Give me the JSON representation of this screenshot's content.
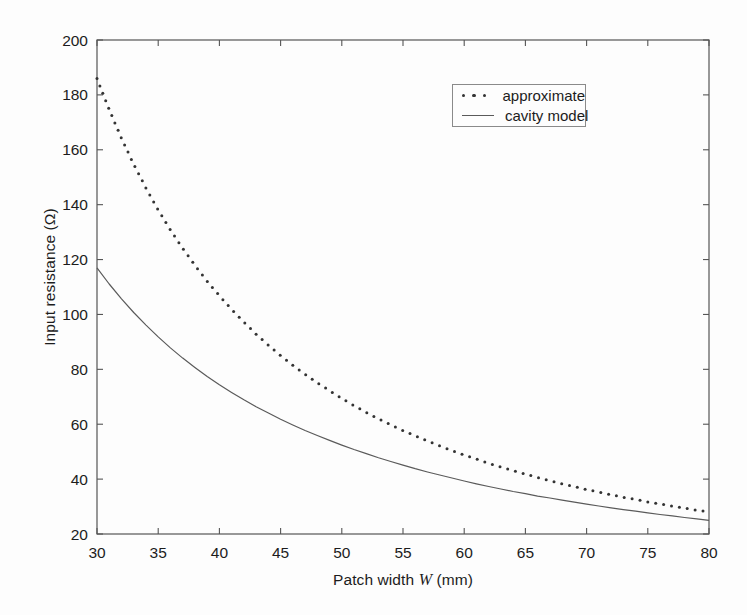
{
  "figure": {
    "background": "#fdfdfd",
    "ink_color": "#1c1c1c",
    "axis_color": "#555555"
  },
  "chart_data": {
    "type": "line",
    "title": "",
    "xlabel": "Patch width W (mm)",
    "xlabel_parts": {
      "prefix": "Patch width ",
      "italic": "W",
      "suffix": " (mm)"
    },
    "ylabel": "Input resistance (Ω)",
    "xlim": [
      30,
      80
    ],
    "ylim": [
      20,
      200
    ],
    "x_ticks": [
      30,
      35,
      40,
      45,
      50,
      55,
      60,
      65,
      70,
      75,
      80
    ],
    "y_ticks": [
      20,
      40,
      60,
      80,
      100,
      120,
      140,
      160,
      180,
      200
    ],
    "grid": false,
    "legend": {
      "position": "top-right",
      "entries": [
        {
          "label": "approximate",
          "style": "dotted"
        },
        {
          "label": "cavity model",
          "style": "solid"
        }
      ]
    },
    "x": [
      30,
      31,
      32,
      33,
      34,
      35,
      36,
      37,
      38,
      39,
      40,
      41,
      42,
      43,
      44,
      45,
      46,
      47,
      48,
      49,
      50,
      51,
      52,
      53,
      54,
      55,
      56,
      57,
      58,
      59,
      60,
      61,
      62,
      63,
      64,
      65,
      66,
      67,
      68,
      69,
      70,
      71,
      72,
      73,
      74,
      75,
      76,
      77,
      78,
      79,
      80
    ],
    "series": [
      {
        "name": "approximate",
        "style": "dotted",
        "color": "#333333",
        "values": [
          186.0,
          174.6,
          164.2,
          154.7,
          146.1,
          138.1,
          130.8,
          124.1,
          117.9,
          112.1,
          106.8,
          101.8,
          97.2,
          92.8,
          88.8,
          85.0,
          81.5,
          78.2,
          75.1,
          72.2,
          69.4,
          66.8,
          64.3,
          62.0,
          59.8,
          57.7,
          55.8,
          53.9,
          52.1,
          50.4,
          48.8,
          47.3,
          45.8,
          44.4,
          43.1,
          41.8,
          40.6,
          39.4,
          38.3,
          37.3,
          36.2,
          35.3,
          34.3,
          33.4,
          32.6,
          31.7,
          30.9,
          30.2,
          29.4,
          28.7,
          28.0
        ]
      },
      {
        "name": "cavity model",
        "style": "solid",
        "color": "#5a5a5a",
        "values": [
          117.0,
          111.1,
          105.7,
          100.7,
          96.1,
          91.8,
          87.8,
          84.1,
          80.7,
          77.4,
          74.4,
          71.6,
          68.9,
          66.4,
          64.1,
          61.8,
          59.7,
          57.7,
          55.9,
          54.1,
          52.4,
          50.8,
          49.3,
          47.8,
          46.4,
          45.1,
          43.8,
          42.6,
          41.5,
          40.4,
          39.3,
          38.3,
          37.3,
          36.4,
          35.5,
          34.7,
          33.8,
          33.1,
          32.3,
          31.6,
          30.9,
          30.2,
          29.5,
          28.9,
          28.3,
          27.7,
          27.1,
          26.6,
          26.0,
          25.5,
          25.0
        ]
      }
    ]
  }
}
